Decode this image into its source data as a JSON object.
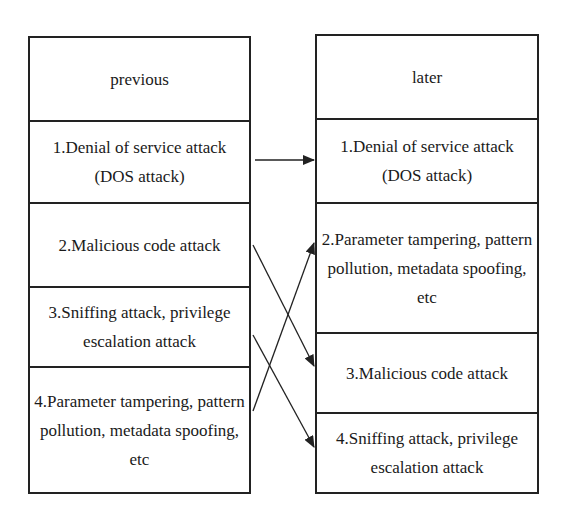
{
  "diagram": {
    "previous": {
      "header": "previous",
      "items": [
        "1.Denial of service attack (DOS attack)",
        "2.Malicious code attack",
        "3.Sniffing attack, privilege escalation attack",
        "4.Parameter tampering, pattern pollution, metadata spoofing, etc"
      ]
    },
    "later": {
      "header": "later",
      "items": [
        "1.Denial of service attack (DOS attack)",
        "2.Parameter tampering, pattern pollution, metadata spoofing, etc",
        "3.Malicious code attack",
        "4.Sniffing attack, privilege escalation attack"
      ]
    },
    "mappings": [
      {
        "from": 1,
        "to": 1
      },
      {
        "from": 2,
        "to": 3
      },
      {
        "from": 3,
        "to": 4
      },
      {
        "from": 4,
        "to": 2
      }
    ],
    "colors": {
      "line": "#222222",
      "background": "#ffffff"
    }
  }
}
